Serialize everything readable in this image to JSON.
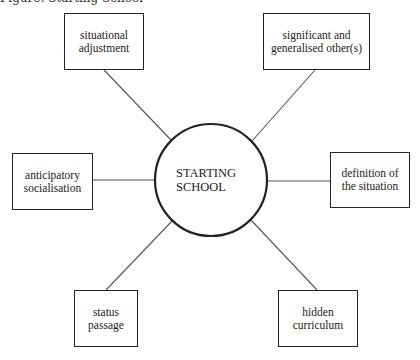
{
  "caption": "Figure: Starting School",
  "center": {
    "label": "STARTING\nSCHOOL",
    "cx": 211,
    "cy": 180,
    "r": 56
  },
  "nodes": [
    {
      "id": "situational-adjustment",
      "label": "situational\nadjustment",
      "x": 64,
      "y": 13,
      "w": 80,
      "h": 57,
      "anchor": [
        104,
        70
      ],
      "target": [
        171,
        140
      ]
    },
    {
      "id": "significant-and-generalised-others",
      "label": "significant and\ngeneralised other(s)",
      "x": 263,
      "y": 13,
      "w": 107,
      "h": 57,
      "anchor": [
        315,
        70
      ],
      "target": [
        252,
        141
      ]
    },
    {
      "id": "anticipatory-socialisation",
      "label": "anticipatory\nsocialisation",
      "x": 12,
      "y": 153,
      "w": 81,
      "h": 57,
      "anchor": [
        93,
        180
      ],
      "target": [
        155,
        180
      ]
    },
    {
      "id": "definition-of-the-situation",
      "label": "definition of\nthe situation",
      "x": 330,
      "y": 152,
      "w": 80,
      "h": 56,
      "anchor": [
        330,
        181
      ],
      "target": [
        267,
        181
      ]
    },
    {
      "id": "status-passage",
      "label": "status\npassage",
      "x": 74,
      "y": 290,
      "w": 64,
      "h": 57,
      "anchor": [
        106,
        290
      ],
      "target": [
        172,
        221
      ]
    },
    {
      "id": "hidden-curriculum",
      "label": "hidden\ncurriculum",
      "x": 278,
      "y": 290,
      "w": 80,
      "h": 57,
      "anchor": [
        317,
        290
      ],
      "target": [
        251,
        220
      ]
    }
  ],
  "colors": {
    "stroke": "#222222",
    "line": "#555555",
    "background": "#ffffff"
  }
}
